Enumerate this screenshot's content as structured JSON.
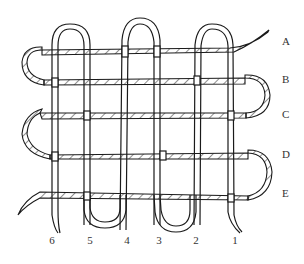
{
  "diagram": {
    "type": "weaving / interlaced strand diagram",
    "row_labels": [
      {
        "label": "A",
        "y": 40
      },
      {
        "label": "B",
        "y": 78
      },
      {
        "label": "C",
        "y": 113
      },
      {
        "label": "D",
        "y": 153
      },
      {
        "label": "E",
        "y": 192
      }
    ],
    "column_labels": [
      {
        "label": "6",
        "x": 52
      },
      {
        "label": "5",
        "x": 90
      },
      {
        "label": "4",
        "x": 127
      },
      {
        "label": "3",
        "x": 159
      },
      {
        "label": "2",
        "x": 196
      },
      {
        "label": "1",
        "x": 235
      }
    ],
    "colors": {
      "stroke": "#1a1a1a",
      "hatch": "#333333",
      "background": "#ffffff",
      "label": "#333333"
    }
  }
}
